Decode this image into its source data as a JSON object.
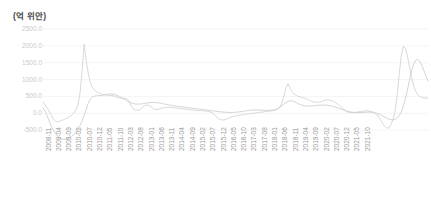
{
  "axis_title": "(억 위안)",
  "chart_data": {
    "type": "line",
    "title": "(억 위안)",
    "xlabel": "",
    "ylabel": "(억 위안)",
    "ylim": [
      -1000,
      2500
    ],
    "yticks": [
      2500.0,
      2000.0,
      1500.0,
      1000.0,
      500.0,
      0.0,
      -500.0
    ],
    "ytick_labels": [
      "2500.0",
      "2000.0",
      "1500.0",
      "1000.0",
      "500.0",
      "0.0",
      "-500.0"
    ],
    "grid": true,
    "legend": "none",
    "xtick_labels": [
      "2008-11",
      "2009-04",
      "2009-09",
      "2010-02",
      "2010-07",
      "2010-12",
      "2011-05",
      "2011-10",
      "2012-03",
      "2012-08",
      "2013-01",
      "2013-06",
      "2013-11",
      "2014-04",
      "2014-09",
      "2015-02",
      "2015-07",
      "2015-12",
      "2016-05",
      "2016-10",
      "2017-03",
      "2017-08",
      "2018-01",
      "2018-06",
      "2018-11",
      "2019-04",
      "2019-09",
      "2020-02",
      "2020-07",
      "2020-12",
      "2021-05",
      "2021-10"
    ],
    "xtick_interval_months": 5,
    "x_start": "2008-11",
    "x_end": "2021-12",
    "series": [
      {
        "name": "series-1",
        "color": "#d4d4d4",
        "values": [
          340,
          250,
          170,
          60,
          -60,
          -170,
          -230,
          -250,
          -240,
          -215,
          -190,
          -160,
          -130,
          -95,
          -50,
          10,
          100,
          260,
          600,
          1250,
          2050,
          1560,
          1180,
          900,
          760,
          690,
          640,
          600,
          575,
          560,
          550,
          540,
          535,
          530,
          520,
          505,
          470,
          455,
          450,
          445,
          440,
          420,
          330,
          200,
          120,
          95,
          90,
          100,
          150,
          215,
          245,
          240,
          215,
          170,
          120,
          105,
          120,
          145,
          160,
          170,
          175,
          178,
          175,
          168,
          160,
          152,
          145,
          140,
          132,
          125,
          120,
          112,
          105,
          98,
          90,
          84,
          80,
          76,
          72,
          66,
          58,
          44,
          20,
          -20,
          -90,
          -150,
          -185,
          -200,
          -195,
          -175,
          -150,
          -125,
          -105,
          -88,
          -75,
          -62,
          -50,
          -40,
          -30,
          -22,
          -15,
          -8,
          0,
          8,
          16,
          24,
          32,
          40,
          48,
          56,
          64,
          72,
          80,
          95,
          125,
          180,
          300,
          520,
          760,
          880,
          740,
          640,
          570,
          530,
          500,
          480,
          465,
          450,
          430,
          400,
          370,
          345,
          330,
          325,
          330,
          345,
          370,
          390,
          400,
          395,
          380,
          355,
          320,
          280,
          230,
          175,
          120,
          70,
          35,
          20,
          18,
          22,
          30,
          40,
          52,
          62,
          70,
          72,
          68,
          58,
          40,
          10,
          -40,
          -110,
          -200,
          -300,
          -390,
          -440,
          -430,
          -340,
          -180,
          60,
          520,
          1150,
          1700,
          1980,
          1930,
          1700,
          1380,
          1060,
          820,
          660,
          560,
          500,
          470,
          455,
          450,
          450
        ]
      },
      {
        "name": "series-2",
        "color": "#cfcfcf",
        "values": [
          160,
          70,
          -70,
          -230,
          -380,
          -500,
          -600,
          -680,
          -730,
          -760,
          -770,
          -765,
          -750,
          -720,
          -680,
          -630,
          -560,
          -470,
          -360,
          -220,
          -60,
          120,
          300,
          420,
          480,
          510,
          520,
          525,
          530,
          535,
          545,
          560,
          570,
          575,
          570,
          555,
          530,
          500,
          465,
          430,
          395,
          360,
          330,
          305,
          285,
          275,
          270,
          272,
          278,
          288,
          300,
          310,
          318,
          322,
          322,
          318,
          310,
          300,
          288,
          275,
          262,
          250,
          238,
          228,
          218,
          210,
          202,
          195,
          188,
          180,
          172,
          164,
          156,
          148,
          140,
          132,
          124,
          116,
          108,
          100,
          92,
          84,
          76,
          68,
          60,
          52,
          45,
          38,
          32,
          28,
          25,
          24,
          25,
          28,
          33,
          40,
          48,
          58,
          68,
          78,
          86,
          92,
          96,
          98,
          98,
          96,
          93,
          90,
          88,
          87,
          88,
          92,
          100,
          115,
          140,
          175,
          220,
          272,
          320,
          355,
          370,
          365,
          345,
          315,
          285,
          258,
          238,
          225,
          218,
          215,
          216,
          220,
          226,
          232,
          238,
          242,
          244,
          243,
          238,
          230,
          218,
          203,
          185,
          165,
          143,
          120,
          98,
          78,
          60,
          45,
          34,
          26,
          22,
          20,
          21,
          24,
          28,
          32,
          34,
          33,
          28,
          18,
          2,
          -20,
          -48,
          -80,
          -115,
          -148,
          -175,
          -192,
          -195,
          -180,
          -140,
          -70,
          40,
          200,
          420,
          690,
          980,
          1250,
          1450,
          1570,
          1600,
          1540,
          1420,
          1270,
          1110,
          960
        ]
      }
    ]
  }
}
